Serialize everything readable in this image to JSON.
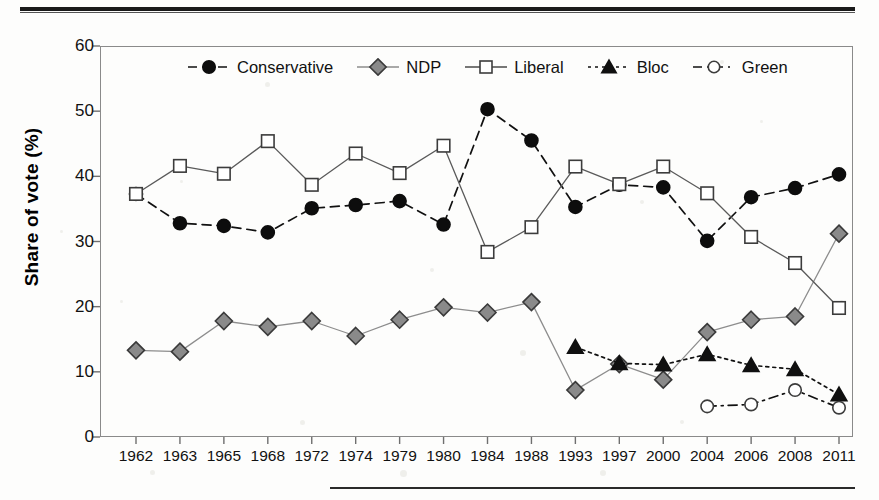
{
  "figure": {
    "background_color": "#fdfdfc",
    "frame_color": "#8a8a8a",
    "has_top_rule": true,
    "has_bottom_rule": true
  },
  "chart_data": {
    "type": "line",
    "title": "",
    "subtitle": "",
    "xlabel": "",
    "ylabel": "Share of vote (%)",
    "ylim": [
      0,
      60
    ],
    "ytick_labels": [
      "0",
      "10",
      "20",
      "30",
      "40",
      "50",
      "60"
    ],
    "yticks": [
      0,
      10,
      20,
      30,
      40,
      50,
      60
    ],
    "grid": false,
    "legend_position": "top-center-inside",
    "categories": [
      "1962",
      "1963",
      "1965",
      "1968",
      "1972",
      "1974",
      "1979",
      "1980",
      "1984",
      "1988",
      "1993",
      "1997",
      "2000",
      "2004",
      "2006",
      "2008",
      "2011"
    ],
    "series": [
      {
        "name": "Conservative",
        "color": "#000000",
        "marker": "filled-circle",
        "line_style": "dashed",
        "values": [
          37.3,
          32.8,
          32.4,
          31.4,
          35.0,
          35.4,
          36.0,
          32.5,
          50.3,
          43.0,
          16.0,
          18.8,
          12.2,
          29.6,
          36.3,
          37.6,
          39.6
        ]
      },
      {
        "name": "NDP",
        "color": "#7a7a7a",
        "marker": "filled-diamond",
        "line_style": "solid",
        "values": [
          13.4,
          13.1,
          17.9,
          16.9,
          17.8,
          15.4,
          17.9,
          19.8,
          18.8,
          20.4,
          6.9,
          11.0,
          8.5,
          15.7,
          17.5,
          18.2,
          30.6
        ]
      },
      {
        "name": "Liberal",
        "color": "#ffffff",
        "marker": "open-square",
        "line_style": "solid",
        "values": [
          37.3,
          41.7,
          40.2,
          45.4,
          38.4,
          43.2,
          40.1,
          44.3,
          28.0,
          31.9,
          41.3,
          38.5,
          40.8,
          36.7,
          30.2,
          26.2,
          18.9
        ]
      },
      {
        "name": "Bloc",
        "color": "#000000",
        "marker": "filled-triangle",
        "line_style": "dotted",
        "values": [
          null,
          null,
          null,
          null,
          null,
          null,
          null,
          null,
          null,
          null,
          13.5,
          10.7,
          10.7,
          12.4,
          10.5,
          10.0,
          6.1
        ]
      },
      {
        "name": "Green",
        "color": "#ffffff",
        "marker": "open-circle",
        "line_style": "dash-dot",
        "values": [
          null,
          null,
          null,
          null,
          null,
          null,
          null,
          null,
          null,
          null,
          null,
          null,
          null,
          4.3,
          4.5,
          6.8,
          3.9
        ]
      }
    ],
    "series_display": [
      {
        "name": "Conservative",
        "values": [
          37.3,
          32.8,
          32.4,
          31.4,
          35.1,
          35.6,
          36.2,
          32.6,
          50.3,
          45.5,
          35.3,
          38.7,
          38.3,
          30.1,
          36.8,
          38.2,
          40.3
        ]
      },
      {
        "name": "NDP",
        "values": [
          13.3,
          13.1,
          17.8,
          16.9,
          17.8,
          15.5,
          18.0,
          19.9,
          19.1,
          20.7,
          7.2,
          11.2,
          8.8,
          16.1,
          18.0,
          18.5,
          31.2
        ]
      },
      {
        "name": "Liberal",
        "values": [
          37.3,
          41.6,
          40.4,
          45.4,
          38.7,
          43.5,
          40.5,
          44.7,
          28.4,
          32.2,
          41.5,
          38.8,
          41.5,
          37.4,
          30.7,
          26.7,
          19.8
        ]
      },
      {
        "name": "Bloc",
        "values": [
          null,
          null,
          null,
          null,
          null,
          null,
          null,
          null,
          null,
          null,
          13.8,
          11.3,
          11.1,
          12.7,
          11.0,
          10.4,
          6.5
        ]
      },
      {
        "name": "Green",
        "values": [
          null,
          null,
          null,
          null,
          null,
          null,
          null,
          null,
          null,
          null,
          null,
          null,
          null,
          4.7,
          5.0,
          7.2,
          4.5
        ]
      }
    ]
  },
  "legend": {
    "items": [
      {
        "label": "Conservative",
        "marker": "filled-circle",
        "line_style": "dashed"
      },
      {
        "label": "NDP",
        "marker": "filled-diamond",
        "line_style": "solid"
      },
      {
        "label": "Liberal",
        "marker": "open-square",
        "line_style": "solid"
      },
      {
        "label": "Bloc",
        "marker": "filled-triangle",
        "line_style": "dotted"
      },
      {
        "label": "Green",
        "marker": "open-circle",
        "line_style": "dash-dot"
      }
    ]
  }
}
